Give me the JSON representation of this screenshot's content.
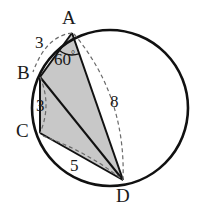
{
  "figure": {
    "colors": {
      "stroke": "#111111",
      "fill": "#c8c8c8",
      "dashed": "#5a5a5a",
      "label": "#1a1a1a"
    },
    "circle": {
      "cx": 110,
      "cy": 108,
      "r": 78
    },
    "vertices": [
      {
        "id": "A",
        "label": "A",
        "x": 72,
        "y": 33
      },
      {
        "id": "B",
        "label": "B",
        "x": 40,
        "y": 77
      },
      {
        "id": "C",
        "label": "C",
        "x": 40,
        "y": 133
      },
      {
        "id": "D",
        "label": "D",
        "x": 123,
        "y": 180
      }
    ],
    "measures": {
      "ab": "3",
      "bc": "3",
      "cd": "5",
      "ad": "8"
    },
    "angle": {
      "value": "60",
      "degree_symbol": "°",
      "at_vertex": "A",
      "between": "AB and AD"
    }
  }
}
